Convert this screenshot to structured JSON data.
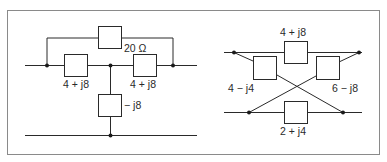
{
  "figure": {
    "top_cropped_text": "",
    "colors": {
      "line": "#2a2a2a",
      "border": "#8a8a8a",
      "background": "#ffffff"
    }
  },
  "left_circuit": {
    "name": "bridged-tee network",
    "impedances": {
      "bridge": "20 Ω",
      "series_left": "4 + j8",
      "series_right": "4 + j8",
      "shunt": "− j8"
    }
  },
  "right_circuit": {
    "name": "lattice network",
    "impedances": {
      "top": "4 + j8",
      "bottom": "2 + j4",
      "cross_left": "4 − j4",
      "cross_right": "6 − j8"
    }
  }
}
